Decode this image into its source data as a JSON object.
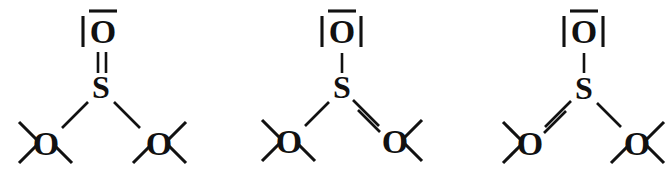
{
  "diagram": {
    "background_color": "#ffffff",
    "ink_color": "#111111",
    "width": 671,
    "height": 179,
    "structure_count": 3,
    "molecule": "SO3 2-",
    "central_atom": "S",
    "terminal_atom": "O",
    "labels": {
      "sulfur": "S",
      "oxygen": "O"
    },
    "structures": [
      {
        "id": "resonance-structure-1",
        "index": 1,
        "x_offset": 0,
        "center_label": "S",
        "bonds": [
          {
            "position": "top",
            "label": "O",
            "order": 2,
            "order_name": "double"
          },
          {
            "position": "bottom-left",
            "label": "O",
            "order": 1,
            "order_name": "single"
          },
          {
            "position": "bottom-right",
            "label": "O",
            "order": 1,
            "order_name": "single"
          }
        ],
        "lone_pairs": {
          "top": 2,
          "bottom-left": 3,
          "bottom-right": 3
        }
      },
      {
        "id": "resonance-structure-2",
        "index": 2,
        "x_offset": 224,
        "center_label": "S",
        "bonds": [
          {
            "position": "top",
            "label": "O",
            "order": 1,
            "order_name": "single"
          },
          {
            "position": "bottom-left",
            "label": "O",
            "order": 1,
            "order_name": "single"
          },
          {
            "position": "bottom-right",
            "label": "O",
            "order": 2,
            "order_name": "double"
          }
        ],
        "lone_pairs": {
          "top": 3,
          "bottom-left": 3,
          "bottom-right": 2
        }
      },
      {
        "id": "resonance-structure-3",
        "index": 3,
        "x_offset": 447,
        "center_label": "S",
        "bonds": [
          {
            "position": "top",
            "label": "O",
            "order": 1,
            "order_name": "single"
          },
          {
            "position": "bottom-left",
            "label": "O",
            "order": 2,
            "order_name": "double"
          },
          {
            "position": "bottom-right",
            "label": "O",
            "order": 1,
            "order_name": "single"
          }
        ],
        "lone_pairs": {
          "top": 3,
          "bottom-left": 2,
          "bottom-right": 3
        }
      }
    ]
  }
}
